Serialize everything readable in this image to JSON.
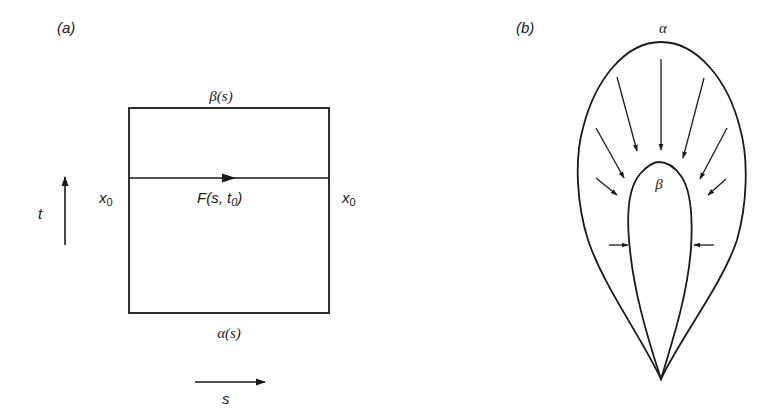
{
  "panel_a": {
    "label": "(a)",
    "top_edge_label": "β(s)",
    "bottom_edge_label": "α(s)",
    "left_side_label": {
      "base": "x",
      "sub": "0"
    },
    "right_side_label": {
      "base": "x",
      "sub": "0"
    },
    "middle_path_label": {
      "prefix": "F(s, t",
      "sub": "0",
      "suffix": ")"
    },
    "vertical_axis_label": "t",
    "horizontal_axis_label": "s"
  },
  "panel_b": {
    "label": "(b)",
    "outer_curve_label": "α",
    "inner_curve_label": "β",
    "arrows_description": "homotopy arrows pointing from outer loop α inward toward inner loop β"
  },
  "colors": {
    "stroke": "#1a1a1a",
    "background": "#ffffff"
  }
}
